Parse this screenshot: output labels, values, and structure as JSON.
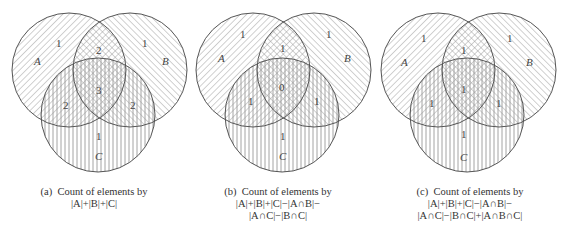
{
  "figure": {
    "diagrams": [
      {
        "id": "a",
        "offset_x": 0,
        "set_labels": {
          "A": "A",
          "B": "B",
          "C": "C"
        },
        "regions": {
          "A_only": "1",
          "B_only": "1",
          "C_only": "1",
          "AB_only": "2",
          "AC_only": "2",
          "BC_only": "2",
          "ABC": "3"
        },
        "caption": {
          "prefix": "(a)",
          "line1": "Count of elements by",
          "line2": "|A|+|B|+|C|",
          "line3": ""
        }
      },
      {
        "id": "b",
        "offset_x": 184,
        "set_labels": {
          "A": "A",
          "B": "B",
          "C": "C"
        },
        "regions": {
          "A_only": "1",
          "B_only": "1",
          "C_only": "1",
          "AB_only": "1",
          "AC_only": "1",
          "BC_only": "1",
          "ABC": "0"
        },
        "caption": {
          "prefix": "(b)",
          "line1": "Count of elements by",
          "line2": "|A|+|B|+|C|−|A∩B|−",
          "line3": "|A∩C|−|B∩C|"
        }
      },
      {
        "id": "c",
        "offset_x": 369,
        "set_labels": {
          "A": "A",
          "B": "B",
          "C": "C"
        },
        "regions": {
          "A_only": "1",
          "B_only": "1",
          "C_only": "1",
          "AB_only": "1",
          "AC_only": "1",
          "BC_only": "1",
          "ABC": "1"
        },
        "caption": {
          "prefix": "(c)",
          "line1": "Count of elements by",
          "line2": "|A|+|B|+|C|−|A∩B|−",
          "line3": "|A∩C|−|B∩C|+|A∩B∩C|"
        }
      }
    ],
    "colors": {
      "outline": "#555555",
      "hatch": "#9a9a9a",
      "text": "#333333"
    },
    "hatching": {
      "A": "diagonal-forward",
      "B": "diagonal-backward",
      "C": "vertical"
    }
  }
}
